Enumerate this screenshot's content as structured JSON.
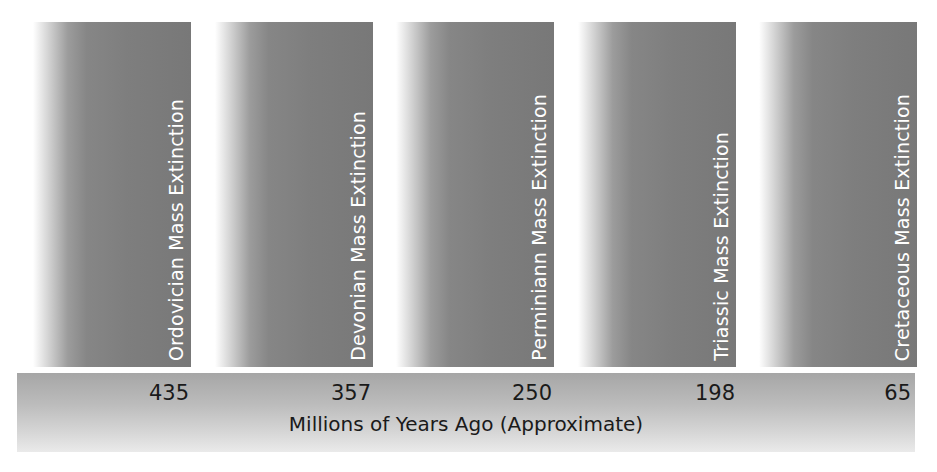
{
  "diagram": {
    "type": "timeline",
    "axis_title": "Millions of Years Ago (Approximate)",
    "events": [
      {
        "label": "Ordovician Mass Extinction",
        "year": "435"
      },
      {
        "label": "Devonian Mass Extinction",
        "year": "357"
      },
      {
        "label": "Perminiann Mass Extinction",
        "year": "250"
      },
      {
        "label": "Triassic Mass Extinction",
        "year": "198"
      },
      {
        "label": "Cretaceous Mass Extinction",
        "year": "65"
      }
    ],
    "colors": {
      "bar_gray": "#7e7e7e",
      "band_top": "#a6a6a6",
      "band_bottom": "#eaeaea",
      "bar_text": "#ffffff",
      "axis_text": "#1a1a1a"
    }
  }
}
